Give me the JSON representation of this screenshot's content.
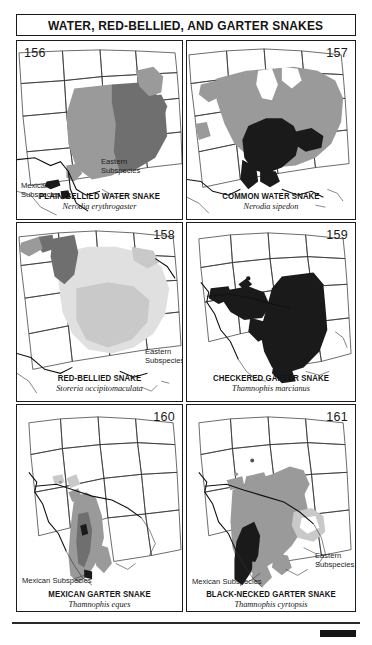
{
  "page": {
    "title": "WATER, RED-BELLIED, AND GARTER SNAKES",
    "background_color": "#ffffff",
    "ink_color": "#1a1a1a"
  },
  "legend_colors": {
    "range_light": "#c9c9c9",
    "range_mid": "#9a9a9a",
    "range_dark": "#6f6f6f",
    "range_black": "#1a1a1a",
    "state_outline": "#2b2b2b",
    "water_outline": "#111111"
  },
  "panels": [
    {
      "number": "156",
      "number_position": "left",
      "common_name": "PLAIN-BELLIED WATER SNAKE",
      "scientific_name": "Nerodia erythrogaster",
      "labels": [
        {
          "text": "Eastern\nSubspecies",
          "line1": "Eastern",
          "line2": "Subspecies"
        },
        {
          "text": "Mexican\nSubspecies",
          "line1": "Mexican",
          "line2": "Subspecies"
        }
      ]
    },
    {
      "number": "157",
      "number_position": "right",
      "common_name": "COMMON WATER SNAKE",
      "scientific_name": "Nerodia sipedon",
      "labels": []
    },
    {
      "number": "158",
      "number_position": "right",
      "common_name": "RED-BELLIED SNAKE",
      "scientific_name": "Storeria occipitomaculata",
      "labels": [
        {
          "text": "Eastern\nSubspecies",
          "line1": "Eastern",
          "line2": "Subspecies"
        }
      ]
    },
    {
      "number": "159",
      "number_position": "right",
      "common_name": "CHECKERED GARTER SNAKE",
      "scientific_name": "Thamnophis marcianus",
      "labels": []
    },
    {
      "number": "160",
      "number_position": "right",
      "common_name": "MEXICAN GARTER SNAKE",
      "scientific_name": "Thamnophis eques",
      "labels": [
        {
          "text": "Mexican Subspecies",
          "line1": "Mexican Subspecies",
          "line2": ""
        }
      ]
    },
    {
      "number": "161",
      "number_position": "right",
      "common_name": "BLACK-NECKED GARTER SNAKE",
      "scientific_name": "Thamnophis cyrtopsis",
      "labels": [
        {
          "text": "Mexican Subspecies",
          "line1": "Mexican Subspecies",
          "line2": ""
        },
        {
          "text": "Eastern\nSubspecies",
          "line1": "Eastern",
          "line2": "Subspecies"
        }
      ]
    }
  ]
}
